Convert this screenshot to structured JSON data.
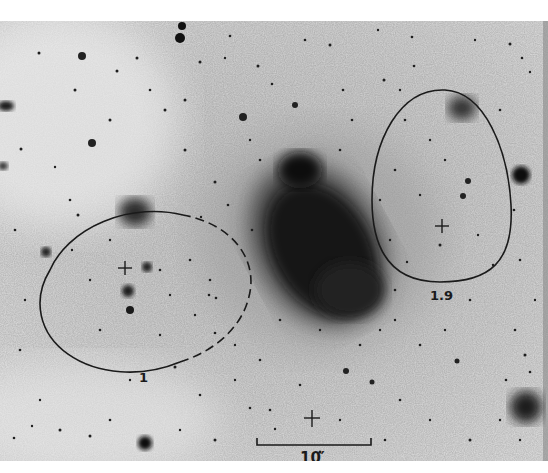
{
  "figure": {
    "type": "astronomical-photographic-plate-negative",
    "background_color": "#d9d9d9",
    "ink_color": "#1a1a1a"
  },
  "regions": [
    {
      "id": "region-1",
      "label": "1",
      "shape": "ellipse",
      "outline": "solid-left dashed-right",
      "center_marker": "cross"
    },
    {
      "id": "region-1.9",
      "label": "1.9",
      "shape": "egg",
      "outline": "solid",
      "center_marker": "cross"
    }
  ],
  "labels": {
    "region_left": "1",
    "region_right": "1.9",
    "scale_bar": "10′"
  },
  "scale_bar": {
    "length_label": "10′"
  },
  "markers": [
    {
      "type": "cross",
      "location": "left-ellipse-center"
    },
    {
      "type": "cross",
      "location": "right-egg-center"
    },
    {
      "type": "cross",
      "location": "above-scale-bar"
    }
  ]
}
